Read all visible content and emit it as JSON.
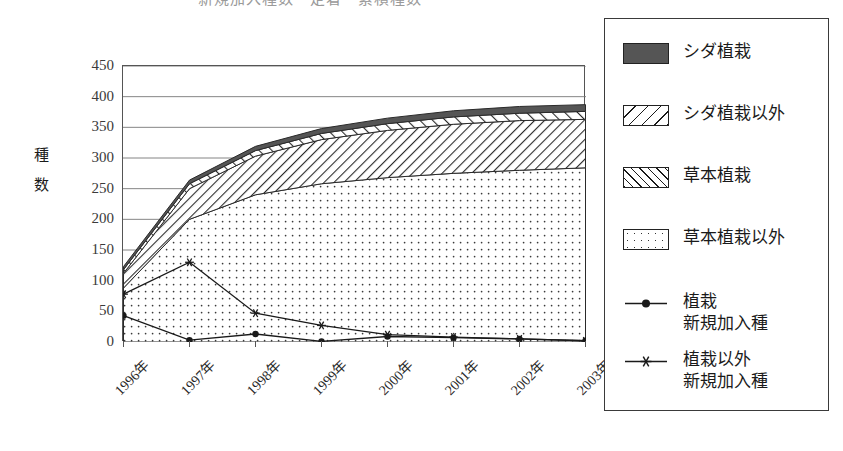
{
  "chart_data": {
    "type": "area",
    "title": "新規加入種数・定着・累積種数",
    "xlabel": "",
    "ylabel": "種数",
    "ylim": [
      0,
      450
    ],
    "ytick_step": 50,
    "yticks": [
      "450",
      "400",
      "350",
      "300",
      "250",
      "200",
      "150",
      "100",
      "50",
      "0"
    ],
    "grid": true,
    "legend_position": "right",
    "categories": [
      "1996年",
      "1997年",
      "1998年",
      "1999年",
      "2000年",
      "2001年",
      "2002年",
      "2003年"
    ],
    "stacked_order_bottom_to_top": [
      "草本植栽以外",
      "草本植栽",
      "シダ植栽以外",
      "シダ植栽"
    ],
    "series": [
      {
        "name": "草本植栽以外",
        "kind": "area",
        "pattern": "dots",
        "values": [
          88,
          200,
          240,
          258,
          268,
          275,
          280,
          284
        ]
      },
      {
        "name": "草本植栽",
        "kind": "area",
        "pattern": "hatch-right",
        "values": [
          24,
          50,
          63,
          72,
          77,
          80,
          81,
          79
        ]
      },
      {
        "name": "シダ植栽以外",
        "kind": "area",
        "pattern": "hatch-left",
        "values": [
          6,
          8,
          9,
          10,
          11,
          12,
          12,
          13
        ]
      },
      {
        "name": "シダ植栽",
        "kind": "area",
        "pattern": "solid-dark",
        "values": [
          5,
          6,
          7,
          8,
          9,
          10,
          11,
          11
        ]
      },
      {
        "name": "植栽\n新規加入種",
        "kind": "line",
        "marker": "dot",
        "values": [
          43,
          3,
          13,
          1,
          9,
          7,
          5,
          2
        ]
      },
      {
        "name": "植栽以外\n新規加入種",
        "kind": "line",
        "marker": "asterisk",
        "values": [
          78,
          130,
          47,
          27,
          12,
          8,
          5,
          2
        ]
      }
    ],
    "cumulative_top": [
      123,
      264,
      319,
      348,
      365,
      377,
      384,
      387
    ]
  },
  "legend": {
    "items": [
      {
        "label": "シダ植栽",
        "swatch": "solid-dark"
      },
      {
        "label": "シダ植栽以外",
        "swatch": "hatch-left"
      },
      {
        "label": "草本植栽",
        "swatch": "hatch-right"
      },
      {
        "label": "草本植栽以外",
        "swatch": "dots"
      },
      {
        "label": "植栽\n新規加入種",
        "swatch": "line-dot"
      },
      {
        "label": "植栽以外\n新規加入種",
        "swatch": "line-asterisk"
      }
    ]
  },
  "colors": {
    "axis": "#555555",
    "grid": "#777777",
    "fern_fill": "#555555",
    "line": "#1a1a1a",
    "text": "#1a1a1a"
  }
}
